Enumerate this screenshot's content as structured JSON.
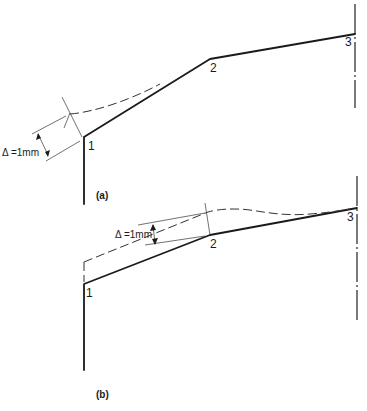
{
  "figure": {
    "panels": [
      {
        "caption": "(a)",
        "points": [
          {
            "label": "1"
          },
          {
            "label": "2"
          },
          {
            "label": "3"
          }
        ],
        "dimension_label": "Δ =1mm"
      },
      {
        "caption": "(b)",
        "points": [
          {
            "label": "1"
          },
          {
            "label": "2"
          },
          {
            "label": "3"
          }
        ],
        "dimension_label": "Δ =1mm"
      }
    ],
    "colors": {
      "line": "#1a1a1a",
      "background": "#ffffff"
    }
  }
}
